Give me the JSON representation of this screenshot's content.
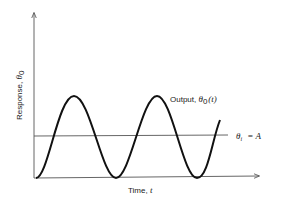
{
  "diagram": {
    "type": "time-response-plot",
    "y_axis_label": "Response, ",
    "y_axis_symbol": "θ",
    "y_axis_subscript": "0",
    "x_axis_label": "Time, ",
    "x_axis_symbol": "t",
    "curve_label": "Output, ",
    "curve_symbol": "θ",
    "curve_subscript": "0",
    "curve_arg": "(t)",
    "reference_label_symbol": "θ",
    "reference_label_subscript": "i",
    "reference_label_rhs": " = A",
    "colors": {
      "curve": "#111111",
      "axes": "#666666",
      "reference_line": "#555555"
    }
  }
}
